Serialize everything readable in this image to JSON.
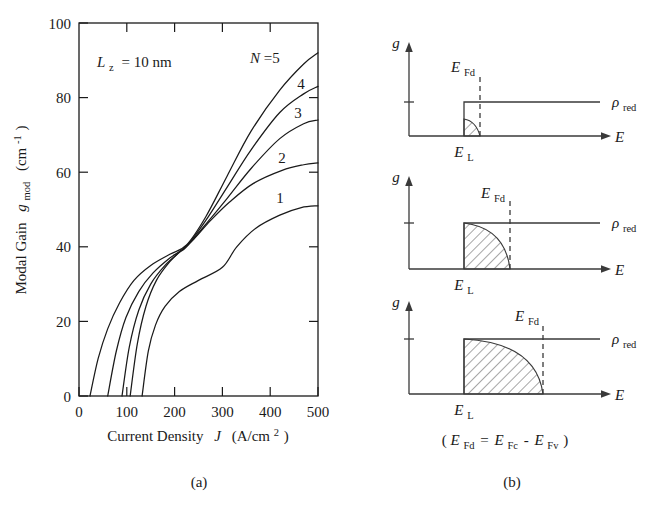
{
  "figure": {
    "panel_a_label": "(a)",
    "panel_b_label": "(b)"
  },
  "chart_data": {
    "type": "line",
    "title": "",
    "xlabel_text": "Current Density",
    "xlabel_symbol": "J",
    "xlabel_units": "(A/cm",
    "xlabel_units_sup": "2",
    "xlabel_units_close": ")",
    "ylabel_text": "Modal Gain",
    "ylabel_symbol": "g",
    "ylabel_symbol_sub": "mod",
    "ylabel_units": "(cm",
    "ylabel_units_sup": "-1",
    "ylabel_units_close": ")",
    "xlim": [
      0,
      500
    ],
    "ylim": [
      0,
      100
    ],
    "xticks": [
      "0",
      "100",
      "200",
      "300",
      "400",
      "500"
    ],
    "yticks": [
      "0",
      "20",
      "40",
      "60",
      "80",
      "100"
    ],
    "xtick_values": [
      0,
      100,
      200,
      300,
      400,
      500
    ],
    "ytick_values": [
      0,
      20,
      40,
      60,
      80,
      100
    ],
    "grid": false,
    "legend_position": "inline-curve-labels",
    "annotation": {
      "symbol": "L",
      "symbol_sub": "z",
      "text": "= 10 nm"
    },
    "series": [
      {
        "name": "N=5",
        "label": "N=5",
        "label_prefix": "N",
        "label_suffix": "=5",
        "points": [
          [
            23,
            0
          ],
          [
            40,
            10
          ],
          [
            60,
            18
          ],
          [
            85,
            25
          ],
          [
            115,
            31
          ],
          [
            150,
            35
          ],
          [
            190,
            38
          ],
          [
            225,
            40.5
          ],
          [
            265,
            48
          ],
          [
            310,
            59
          ],
          [
            360,
            71
          ],
          [
            420,
            82
          ],
          [
            470,
            89
          ],
          [
            500,
            92
          ]
        ]
      },
      {
        "name": "N=4",
        "label": "4",
        "label_prefix": "",
        "label_suffix": "4",
        "points": [
          [
            60,
            0
          ],
          [
            78,
            12
          ],
          [
            98,
            21
          ],
          [
            125,
            28
          ],
          [
            155,
            33
          ],
          [
            190,
            37
          ],
          [
            225,
            40.2
          ],
          [
            265,
            47
          ],
          [
            310,
            56
          ],
          [
            360,
            66
          ],
          [
            420,
            76
          ],
          [
            470,
            81
          ],
          [
            500,
            83
          ]
        ]
      },
      {
        "name": "N=3",
        "label": "3",
        "label_prefix": "",
        "label_suffix": "3",
        "points": [
          [
            90,
            0
          ],
          [
            105,
            13
          ],
          [
            125,
            23
          ],
          [
            150,
            30
          ],
          [
            180,
            35
          ],
          [
            210,
            38.5
          ],
          [
            225,
            40
          ],
          [
            265,
            46
          ],
          [
            310,
            53
          ],
          [
            360,
            61
          ],
          [
            420,
            69
          ],
          [
            470,
            73
          ],
          [
            500,
            74
          ]
        ]
      },
      {
        "name": "N=2",
        "label": "2",
        "label_prefix": "",
        "label_suffix": "2",
        "points": [
          [
            107,
            0
          ],
          [
            122,
            14
          ],
          [
            140,
            24
          ],
          [
            162,
            31
          ],
          [
            190,
            36
          ],
          [
            218,
            39.5
          ],
          [
            240,
            42
          ],
          [
            275,
            47
          ],
          [
            315,
            52
          ],
          [
            365,
            57
          ],
          [
            425,
            60.5
          ],
          [
            470,
            62
          ],
          [
            500,
            62.5
          ]
        ]
      },
      {
        "name": "N=1",
        "label": "1",
        "label_prefix": "",
        "label_suffix": "1",
        "points": [
          [
            132,
            0
          ],
          [
            145,
            12
          ],
          [
            160,
            19
          ],
          [
            180,
            24
          ],
          [
            210,
            28
          ],
          [
            250,
            31
          ],
          [
            300,
            34.5
          ],
          [
            330,
            40
          ],
          [
            370,
            45
          ],
          [
            420,
            48.5
          ],
          [
            465,
            50.5
          ],
          [
            500,
            51
          ]
        ]
      }
    ]
  },
  "panel_b": {
    "caption_symbol_1": "E",
    "caption_sub_1": "Fd",
    "caption_eq": "=",
    "caption_symbol_2": "E",
    "caption_sub_2": "Fc",
    "caption_minus": "-",
    "caption_symbol_3": "E",
    "caption_sub_3": "Fv",
    "caption_open": "(",
    "caption_close": ")",
    "diagrams": [
      {
        "id": "top",
        "y_axis_label": "g",
        "x_axis_label": "E",
        "fermi_label": "E",
        "fermi_sub": "Fd",
        "level_label": "E",
        "level_sub": "L",
        "density_label": "ρ",
        "density_sub": "red",
        "fill_extent": "small"
      },
      {
        "id": "middle",
        "y_axis_label": "g",
        "x_axis_label": "E",
        "fermi_label": "E",
        "fermi_sub": "Fd",
        "level_label": "E",
        "level_sub": "L",
        "density_label": "ρ",
        "density_sub": "red",
        "fill_extent": "medium"
      },
      {
        "id": "bottom",
        "y_axis_label": "g",
        "x_axis_label": "E",
        "fermi_label": "E",
        "fermi_sub": "Fd",
        "level_label": "E",
        "level_sub": "L",
        "density_label": "ρ",
        "density_sub": "red",
        "fill_extent": "large"
      }
    ]
  },
  "colors": {
    "ink": "#1a1a1a",
    "diagram_ink": "#3a3a3a",
    "background": "#ffffff"
  }
}
